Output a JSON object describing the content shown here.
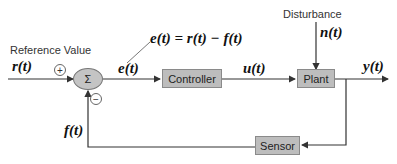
{
  "labels": {
    "reference_value": "Reference Value",
    "disturbance": "Disturbance"
  },
  "signals": {
    "r": "r(t)",
    "e_left": "e(t)",
    "e_equation": "e(t) = r(t) − f(t)",
    "u": "u(t)",
    "n": "n(t)",
    "y": "y(t)",
    "f": "f(t)"
  },
  "blocks": {
    "summing_junction": "Σ",
    "controller": "Controller",
    "plant": "Plant",
    "sensor": "Sensor"
  },
  "signs": {
    "plus": "+",
    "minus": "−"
  }
}
